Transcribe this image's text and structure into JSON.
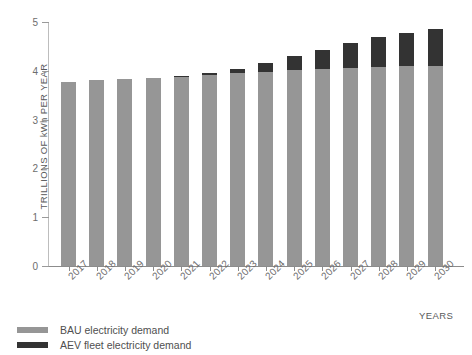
{
  "chart_data": {
    "type": "bar",
    "stacked": true,
    "title": "",
    "xlabel": "YEARS",
    "ylabel": "TRILLIONS OF kWh PER YEAR",
    "ylim": [
      0,
      5
    ],
    "yticks": [
      0,
      1,
      2,
      3,
      4,
      5
    ],
    "ytick_labels": [
      "0",
      "1",
      "2",
      "3",
      "4",
      "5"
    ],
    "grid": false,
    "legend_position": "bottom-left",
    "categories": [
      "2017",
      "2018",
      "2019",
      "2020",
      "2021",
      "2022",
      "2023",
      "2024",
      "2025",
      "2026",
      "2027",
      "2028",
      "2029",
      "2030"
    ],
    "series": [
      {
        "name": "BAU electricity demand",
        "color": "#969696",
        "values": [
          3.78,
          3.81,
          3.84,
          3.85,
          3.88,
          3.91,
          3.95,
          3.98,
          4.01,
          4.03,
          4.05,
          4.07,
          4.09,
          4.1
        ]
      },
      {
        "name": "AEV fleet electricity demand",
        "color": "#333333",
        "values": [
          0.0,
          0.0,
          0.0,
          0.0,
          0.01,
          0.04,
          0.09,
          0.18,
          0.29,
          0.4,
          0.52,
          0.62,
          0.69,
          0.75
        ]
      }
    ],
    "totals": [
      3.78,
      3.81,
      3.84,
      3.85,
      3.89,
      3.95,
      4.04,
      4.16,
      4.3,
      4.43,
      4.57,
      4.69,
      4.78,
      4.85
    ]
  },
  "legend": {
    "items": [
      {
        "label": "BAU electricity demand",
        "color": "#969696"
      },
      {
        "label": "AEV fleet electricity demand",
        "color": "#333333"
      }
    ]
  }
}
